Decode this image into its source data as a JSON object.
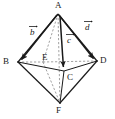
{
  "figure": {
    "type": "geometry-diagram",
    "shape": "octahedron",
    "stroke_color": "#1a1a1a",
    "dashed_color": "#7a7a7a",
    "background": "#ffffff"
  },
  "vertices": [
    {
      "id": "A",
      "label": "A",
      "x": 58,
      "y": 14,
      "label_x": 55,
      "label_y": 1
    },
    {
      "id": "B",
      "label": "B",
      "x": 18,
      "y": 62,
      "label_x": 3,
      "label_y": 57
    },
    {
      "id": "C",
      "label": "C",
      "x": 64,
      "y": 71,
      "label_x": 67,
      "label_y": 73
    },
    {
      "id": "D",
      "label": "D",
      "x": 97,
      "y": 61,
      "label_x": 100,
      "label_y": 56
    },
    {
      "id": "E",
      "label": "E",
      "x": 43,
      "y": 62,
      "label_x": 42,
      "label_y": 53
    },
    {
      "id": "F",
      "label": "F",
      "x": 60,
      "y": 103,
      "label_x": 56,
      "label_y": 106
    }
  ],
  "vectors": [
    {
      "id": "b",
      "label": "b",
      "from": "A",
      "to": "B",
      "label_x": 29,
      "label_y": 25
    },
    {
      "id": "c",
      "label": "c",
      "from": "A",
      "to": "C",
      "label_x": 66,
      "label_y": 33
    },
    {
      "id": "d",
      "label": "d",
      "from": "A",
      "to": "D",
      "label_x": 84,
      "label_y": 20
    }
  ],
  "edges": [
    {
      "from": "A",
      "to": "B",
      "style": "solid"
    },
    {
      "from": "A",
      "to": "D",
      "style": "solid"
    },
    {
      "from": "A",
      "to": "C",
      "style": "solid"
    },
    {
      "from": "A",
      "to": "E",
      "style": "dashed"
    },
    {
      "from": "A",
      "to": "F",
      "style": "dashed"
    },
    {
      "from": "B",
      "to": "C",
      "style": "solid"
    },
    {
      "from": "C",
      "to": "D",
      "style": "solid"
    },
    {
      "from": "B",
      "to": "E",
      "style": "dashed"
    },
    {
      "from": "E",
      "to": "D",
      "style": "dashed"
    },
    {
      "from": "B",
      "to": "F",
      "style": "solid"
    },
    {
      "from": "D",
      "to": "F",
      "style": "solid"
    },
    {
      "from": "C",
      "to": "F",
      "style": "solid"
    },
    {
      "from": "E",
      "to": "F",
      "style": "dashed"
    }
  ]
}
